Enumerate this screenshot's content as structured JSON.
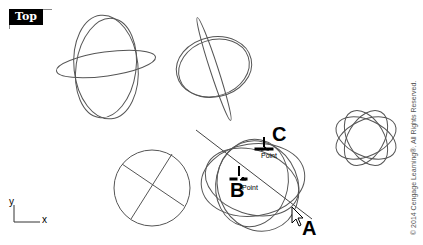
{
  "viewport": {
    "label": "Top",
    "axes": {
      "x_label": "x",
      "y_label": "y"
    }
  },
  "callouts": {
    "a": "A",
    "b": "B",
    "c": "C"
  },
  "snaps": {
    "b_snap": "Point",
    "c_snap": "Point"
  },
  "copyright": "© 2014 Cengage Learning®. All Rights Reserved.",
  "colors": {
    "background": "#ffffff",
    "curve": "#555555",
    "label_bg": "#000000",
    "label_fg": "#ffffff"
  }
}
